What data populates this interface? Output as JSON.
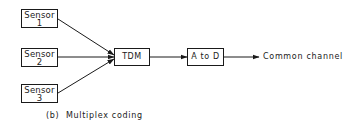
{
  "diagram": {
    "type": "block-diagram",
    "caption": "(b)  Multiplex coding",
    "sensors": [
      {
        "id": "sensor-1",
        "line1": "Sensor",
        "line2": "1"
      },
      {
        "id": "sensor-2",
        "line1": "Sensor",
        "line2": "2"
      },
      {
        "id": "sensor-3",
        "line1": "Sensor",
        "line2": "3"
      }
    ],
    "tdm": {
      "label": "TDM"
    },
    "adc": {
      "label": "A to D"
    },
    "output": {
      "label": "Common channel"
    },
    "edges": [
      {
        "from": "sensor-1",
        "to": "tdm"
      },
      {
        "from": "sensor-2",
        "to": "tdm"
      },
      {
        "from": "sensor-3",
        "to": "tdm"
      },
      {
        "from": "tdm",
        "to": "adc"
      },
      {
        "from": "adc",
        "to": "output"
      }
    ],
    "colors": {
      "stroke": "#1a1a1a",
      "background": "#ffffff"
    }
  }
}
